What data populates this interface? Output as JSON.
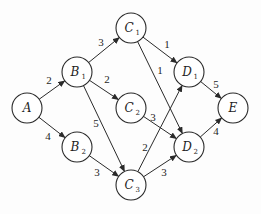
{
  "diagram": {
    "type": "directed-weighted-graph",
    "nodes": [
      {
        "id": "A",
        "label": "A",
        "sub": "",
        "x": 27,
        "y": 108
      },
      {
        "id": "B1",
        "label": "B",
        "sub": "1",
        "x": 77,
        "y": 72
      },
      {
        "id": "B2",
        "label": "B",
        "sub": "2",
        "x": 77,
        "y": 147
      },
      {
        "id": "C1",
        "label": "C",
        "sub": "1",
        "x": 131,
        "y": 28
      },
      {
        "id": "C2",
        "label": "C",
        "sub": "2",
        "x": 131,
        "y": 108
      },
      {
        "id": "C3",
        "label": "C",
        "sub": "3",
        "x": 131,
        "y": 185
      },
      {
        "id": "D1",
        "label": "D",
        "sub": "1",
        "x": 189,
        "y": 72
      },
      {
        "id": "D2",
        "label": "D",
        "sub": "2",
        "x": 189,
        "y": 147
      },
      {
        "id": "E",
        "label": "E",
        "sub": "",
        "x": 233,
        "y": 108
      }
    ],
    "edges": [
      {
        "from": "A",
        "to": "B1",
        "weight": "2",
        "lx": 49,
        "ly": 84
      },
      {
        "from": "A",
        "to": "B2",
        "weight": "4",
        "lx": 48,
        "ly": 140
      },
      {
        "from": "B1",
        "to": "C1",
        "weight": "3",
        "lx": 101,
        "ly": 46
      },
      {
        "from": "B1",
        "to": "C2",
        "weight": "2",
        "lx": 107,
        "ly": 83
      },
      {
        "from": "B1",
        "to": "C3",
        "weight": "5",
        "lx": 96,
        "ly": 127
      },
      {
        "from": "B2",
        "to": "C3",
        "weight": "3",
        "lx": 97,
        "ly": 176
      },
      {
        "from": "C1",
        "to": "D1",
        "weight": "1",
        "lx": 167,
        "ly": 48
      },
      {
        "from": "C1",
        "to": "D2",
        "weight": "1",
        "lx": 160,
        "ly": 74
      },
      {
        "from": "C2",
        "to": "D2",
        "weight": "3",
        "lx": 153,
        "ly": 121
      },
      {
        "from": "C3",
        "to": "D1",
        "weight": "2",
        "lx": 145,
        "ly": 151
      },
      {
        "from": "C3",
        "to": "D2",
        "weight": "3",
        "lx": 164,
        "ly": 176
      },
      {
        "from": "D1",
        "to": "E",
        "weight": "5",
        "lx": 216,
        "ly": 88
      },
      {
        "from": "D2",
        "to": "E",
        "weight": "4",
        "lx": 216,
        "ly": 135
      }
    ],
    "node_radius": 15,
    "colors": {
      "stroke": "#2a2a2a",
      "text": "#1e1e1e",
      "background": "#fdfdfd"
    }
  }
}
